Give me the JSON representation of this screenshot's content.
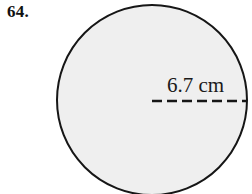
{
  "figure": {
    "problem_number": "64.",
    "shape": "circle",
    "measurement_label": "6.7 cm",
    "measurement_value": 6.7,
    "measurement_unit": "cm",
    "measurement_type": "radius",
    "dimension_line_style": "dashed",
    "colors": {
      "page_background": "#ffffff",
      "circle_fill": "#efefef",
      "circle_stroke": "#161616",
      "dashed_line": "#161616",
      "text": "#111111"
    },
    "geometry": {
      "center_x": 152,
      "center_y": 100,
      "radius_px": 95,
      "stroke_width_px": 2,
      "dash_line_start_x": 152,
      "dash_line_end_x": 247,
      "dash_line_y": 101,
      "dash_length_px": 10,
      "dash_gap_px": 5
    }
  }
}
